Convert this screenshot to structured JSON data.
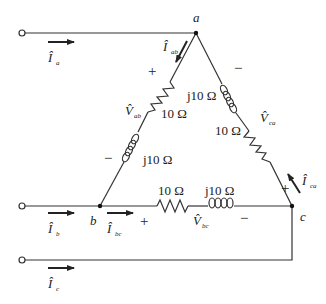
{
  "diagram": {
    "type": "three-phase delta-connected load circuit",
    "nodes": [
      {
        "id": "a",
        "label": "a"
      },
      {
        "id": "b",
        "label": "b"
      },
      {
        "id": "c",
        "label": "c"
      }
    ],
    "line_currents": [
      {
        "id": "Ia",
        "symbol": "Î",
        "sub": "a"
      },
      {
        "id": "Ib",
        "symbol": "Î",
        "sub": "b"
      },
      {
        "id": "Ic",
        "symbol": "Î",
        "sub": "c"
      }
    ],
    "phase_currents": [
      {
        "id": "Iab",
        "symbol": "Î",
        "sub": "ab"
      },
      {
        "id": "Ibc",
        "symbol": "Î",
        "sub": "bc"
      },
      {
        "id": "Ica",
        "symbol": "Î",
        "sub": "ca"
      }
    ],
    "phase_voltages": [
      {
        "id": "Vab",
        "symbol": "V̂",
        "sub": "ab",
        "plus": "+",
        "minus": "−"
      },
      {
        "id": "Vbc",
        "symbol": "V̂",
        "sub": "bc",
        "plus": "+",
        "minus": "−"
      },
      {
        "id": "Vca",
        "symbol": "V̂",
        "sub": "ca",
        "plus": "+",
        "minus": "−"
      }
    ],
    "branches": {
      "ab": {
        "resistor": "10 Ω",
        "inductor": "j10 Ω"
      },
      "bc": {
        "resistor": "10 Ω",
        "inductor": "j10 Ω"
      },
      "ca": {
        "resistor": "10 Ω",
        "inductor": "j10 Ω"
      }
    },
    "labels": {
      "plus": "+",
      "minus": "−",
      "res": "10 Ω",
      "ind": "j10 Ω",
      "hat_I": "Î",
      "hat_V": "V̂"
    }
  }
}
